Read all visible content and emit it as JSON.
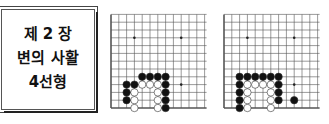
{
  "title_box": {
    "lines": [
      "제 2 장",
      "변의 사활",
      "4선형"
    ]
  },
  "boards": [
    {
      "name": "diagram-1",
      "origin_x": 111,
      "cols": 13,
      "rows": 13,
      "spacing": 7.8,
      "bottom_edge_y": 108,
      "star_points": [
        [
          3,
          3
        ],
        [
          9,
          3
        ],
        [
          3,
          9
        ],
        [
          9,
          9
        ]
      ],
      "black": [
        [
          4,
          4
        ],
        [
          5,
          4
        ],
        [
          6,
          4
        ],
        [
          7,
          4
        ],
        [
          2,
          3
        ],
        [
          3,
          3
        ],
        [
          7,
          3
        ],
        [
          2,
          2
        ],
        [
          7,
          2
        ],
        [
          2,
          1
        ],
        [
          7,
          1
        ],
        [
          7,
          0
        ]
      ],
      "white": [
        [
          4,
          3
        ],
        [
          5,
          3
        ],
        [
          6,
          3
        ],
        [
          3,
          2
        ],
        [
          6,
          2
        ],
        [
          3,
          1
        ],
        [
          6,
          1
        ],
        [
          3,
          0
        ],
        [
          6,
          0
        ]
      ]
    },
    {
      "name": "diagram-2",
      "origin_x": 224,
      "cols": 13,
      "rows": 13,
      "spacing": 7.8,
      "bottom_edge_y": 108,
      "star_points": [
        [
          3,
          3
        ],
        [
          9,
          3
        ],
        [
          3,
          9
        ],
        [
          9,
          9
        ]
      ],
      "black": [
        [
          2,
          4
        ],
        [
          3,
          4
        ],
        [
          4,
          4
        ],
        [
          5,
          4
        ],
        [
          6,
          4
        ],
        [
          7,
          4
        ],
        [
          2,
          3
        ],
        [
          7,
          3
        ],
        [
          2,
          2
        ],
        [
          7,
          2
        ],
        [
          2,
          1
        ],
        [
          7,
          1
        ],
        [
          9,
          1
        ],
        [
          2,
          0
        ]
      ],
      "white": [
        [
          3,
          3
        ],
        [
          4,
          3
        ],
        [
          5,
          3
        ],
        [
          6,
          3
        ],
        [
          3,
          2
        ],
        [
          6,
          2
        ],
        [
          3,
          1
        ],
        [
          6,
          1
        ],
        [
          3,
          0
        ],
        [
          6,
          0
        ]
      ]
    }
  ],
  "colors": {
    "grid": "#555555",
    "black_stone": "#111111",
    "white_stone": "#ffffff",
    "stone_outline": "#333333"
  }
}
